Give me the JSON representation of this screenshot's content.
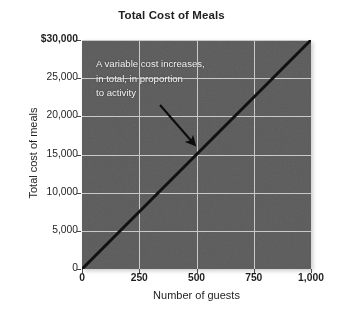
{
  "chart_data": {
    "type": "line",
    "title": "Total Cost of Meals",
    "xlabel": "Number of guests",
    "ylabel": "Total cost of meals",
    "xlim": [
      0,
      1000
    ],
    "ylim": [
      0,
      30000
    ],
    "grid": true,
    "legend": "none",
    "xticks": [
      "0",
      "250",
      "500",
      "750",
      "1,000"
    ],
    "xtick_values": [
      0,
      250,
      500,
      750,
      1000
    ],
    "yticks": [
      "0",
      "5,000",
      "10,000",
      "15,000",
      "20,000",
      "25,000",
      "$30,000"
    ],
    "ytick_values": [
      0,
      5000,
      10000,
      15000,
      20000,
      25000,
      30000
    ],
    "series": [
      {
        "name": "Total cost of meals",
        "color": "#111111",
        "x": [
          0,
          250,
          500,
          750,
          1000
        ],
        "values": [
          0,
          7500,
          15000,
          22500,
          30000
        ]
      }
    ],
    "annotations": [
      {
        "text": "A variable cost increases,\nin total, in proportion\nto activity",
        "arrow_from": [
          330,
          21000
        ],
        "arrow_to": [
          500,
          15000
        ]
      }
    ],
    "colors": {
      "panel_background": "#5b5b5b",
      "gridline": "#c9c9c9",
      "line": "#111111",
      "annotation_text": "#f2f2f2",
      "axis_text": "#1f1f1f",
      "title_text": "#222222",
      "figure_background": "#ffffff"
    }
  }
}
